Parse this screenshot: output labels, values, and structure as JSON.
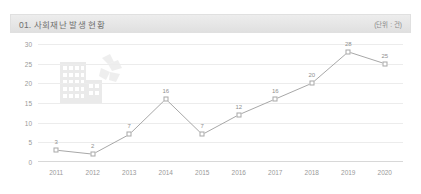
{
  "header": {
    "title": "01. 사회재난 발생 현황",
    "unit": "(단위 : 건)"
  },
  "watermark": {
    "icon_name": "damaged-buildings-illustration"
  },
  "chart_data": {
    "type": "line",
    "title": "01. 사회재난 발생 현황",
    "xlabel": "",
    "ylabel": "",
    "unit": "(단위 : 건)",
    "categories": [
      "2011",
      "2012",
      "2013",
      "2014",
      "2015",
      "2016",
      "2017",
      "2018",
      "2019",
      "2020"
    ],
    "values": [
      3,
      2,
      7,
      16,
      7,
      12,
      16,
      20,
      28,
      25
    ],
    "ylim": [
      0,
      30
    ],
    "yticks": [
      0,
      5,
      10,
      15,
      20,
      25,
      30
    ],
    "grid": true,
    "legend": "none",
    "marker": "open-square",
    "line_color": "#a8a8a8",
    "data_labels": [
      "3",
      "2",
      "7",
      "16",
      "7",
      "12",
      "16",
      "20",
      "28",
      "25"
    ]
  },
  "colors": {
    "header_bg": "#e6e6e6",
    "header_text": "#6f6f6f",
    "grid": "#ececec",
    "axis": "#d8d8d8",
    "tick_text": "#9a9a9a",
    "line": "#a8a8a8",
    "label_text": "#8f8f8f",
    "page_bg": "#ffffff"
  }
}
